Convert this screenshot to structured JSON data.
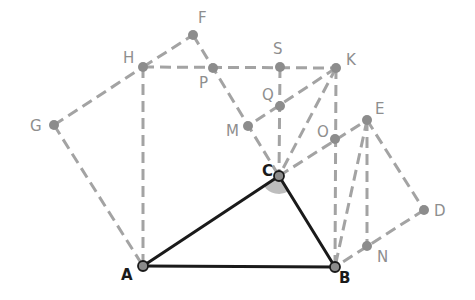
{
  "diagram": {
    "colors": {
      "construction": "#a3a3a3",
      "triangle": "#1a1a1a",
      "point_fill": "#8c8c8c",
      "angle_fill": "#bdbdbd",
      "label_gray": "#8e8e8e",
      "label_black": "#1a1a1a"
    },
    "points": {
      "A": {
        "x": 143,
        "y": 266,
        "label": "A"
      },
      "B": {
        "x": 335,
        "y": 267,
        "label": "B"
      },
      "C": {
        "x": 279,
        "y": 176,
        "label": "C"
      },
      "D": {
        "x": 424,
        "y": 210,
        "label": "D"
      },
      "E": {
        "x": 367,
        "y": 120,
        "label": "E"
      },
      "F": {
        "x": 193,
        "y": 35,
        "label": "F"
      },
      "G": {
        "x": 54,
        "y": 125,
        "label": "G"
      },
      "H": {
        "x": 143,
        "y": 67,
        "label": "H"
      },
      "K": {
        "x": 336,
        "y": 68,
        "label": "K"
      },
      "M": {
        "x": 248,
        "y": 126,
        "label": "M"
      },
      "N": {
        "x": 367,
        "y": 246,
        "label": "N"
      },
      "O": {
        "x": 335,
        "y": 139,
        "label": "O"
      },
      "P": {
        "x": 213,
        "y": 68,
        "label": "P"
      },
      "Q": {
        "x": 280,
        "y": 106,
        "label": "Q"
      },
      "S": {
        "x": 280,
        "y": 67,
        "label": "S"
      }
    },
    "solid_segments": [
      [
        "A",
        "B"
      ],
      [
        "B",
        "C"
      ],
      [
        "C",
        "A"
      ]
    ],
    "dashed_segments": [
      [
        "G",
        "A"
      ],
      [
        "G",
        "H"
      ],
      [
        "H",
        "F"
      ],
      [
        "H",
        "A"
      ],
      [
        "H",
        "K"
      ],
      [
        "F",
        "C"
      ],
      [
        "S",
        "C"
      ],
      [
        "K",
        "M"
      ],
      [
        "K",
        "C"
      ],
      [
        "K",
        "B"
      ],
      [
        "C",
        "E"
      ],
      [
        "E",
        "B"
      ],
      [
        "E",
        "N"
      ],
      [
        "E",
        "D"
      ],
      [
        "D",
        "B"
      ]
    ],
    "angle_marker": {
      "vertex": "C",
      "between": [
        "A",
        "B"
      ],
      "radius": 18
    }
  }
}
